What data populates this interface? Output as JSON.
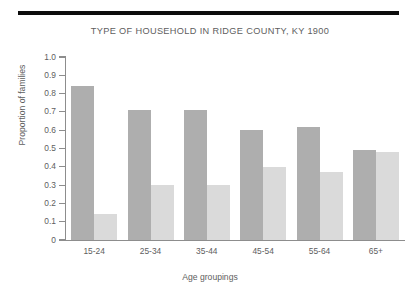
{
  "chart_data": {
    "type": "bar",
    "title": "TYPE OF HOUSEHOLD IN RIDGE COUNTY, KY 1900",
    "xlabel": "Age groupings",
    "ylabel": "Proportion of families",
    "categories": [
      "15-24",
      "25-34",
      "35-44",
      "45-54",
      "55-64",
      "65+"
    ],
    "ylim": [
      0,
      1.0
    ],
    "ytick_labels": [
      "1.0",
      "0.9",
      "0.8",
      "0.7",
      "0.6",
      "0.5",
      "0.4",
      "0.3",
      "0.2",
      "0.1",
      "0"
    ],
    "ytick_values": [
      1.0,
      0.9,
      0.8,
      0.7,
      0.6,
      0.5,
      0.4,
      0.3,
      0.2,
      0.1,
      0
    ],
    "grid": false,
    "legend": "none",
    "series": [
      {
        "name": "series-dark",
        "color": "#aeaeae",
        "values": [
          0.84,
          0.71,
          0.71,
          0.6,
          0.62,
          0.49
        ]
      },
      {
        "name": "series-light",
        "color": "#dadada",
        "values": [
          0.14,
          0.3,
          0.3,
          0.4,
          0.37,
          0.48
        ]
      }
    ]
  },
  "figure": {
    "rule_color": "#0d0d0d",
    "axis_color": "#8d8d8d",
    "text_color": "#5e5e5e"
  }
}
